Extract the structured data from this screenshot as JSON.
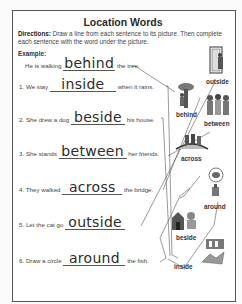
{
  "worksheet": {
    "title": "Location Words",
    "directions_label": "Directions:",
    "directions_text": "Draw a line from each sentence to its picture. Then complete each sentence with the word under the picture.",
    "example_label": "Example:",
    "example": {
      "before": "He is walking",
      "answer": "behind",
      "after": "the tree."
    },
    "sentences": [
      {
        "num": "1.",
        "before": "We stay",
        "answer": "inside",
        "after": "when it rains."
      },
      {
        "num": "2.",
        "before": "She drew a dog",
        "answer": "beside",
        "after": "his house."
      },
      {
        "num": "3.",
        "before": "She stands",
        "answer": "between",
        "after": "her friends."
      },
      {
        "num": "4.",
        "before": "They walked",
        "answer": "across",
        "after": "the bridge."
      },
      {
        "num": "5.",
        "before": "Let the cat go",
        "answer": "outside",
        "after": ""
      },
      {
        "num": "6.",
        "before": "Draw a circle",
        "answer": "around",
        "after": "the fish."
      }
    ],
    "pictures": [
      {
        "label": "outside",
        "icon": "person-at-door-icon"
      },
      {
        "label": "behind",
        "icon": "person-behind-tree-icon"
      },
      {
        "label": "between",
        "icon": "girl-between-friends-icon"
      },
      {
        "label": "across",
        "icon": "people-crossing-bridge-icon"
      },
      {
        "label": "around",
        "icon": "fish-bowl-icon"
      },
      {
        "label": "beside",
        "icon": "dog-beside-house-icon"
      },
      {
        "label": "inside",
        "icon": "kids-inside-house-icon"
      }
    ]
  }
}
